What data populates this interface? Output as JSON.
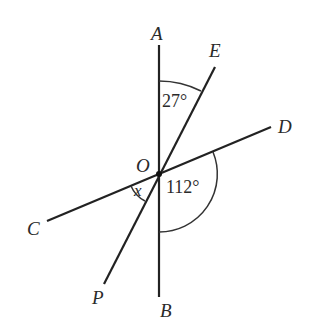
{
  "diagram": {
    "type": "intersecting-lines-angles",
    "center": {
      "label": "O",
      "x": 159,
      "y": 174
    },
    "colors": {
      "line": "#222222",
      "text": "#2a2a2a",
      "background": "#ffffff"
    },
    "lines": [
      {
        "name": "AB",
        "from": "A",
        "to": "B"
      },
      {
        "name": "CD",
        "from": "C",
        "to": "D"
      },
      {
        "name": "PE",
        "from": "P",
        "to": "E"
      }
    ],
    "points": {
      "A": {
        "label": "A",
        "x": 159,
        "y": 45
      },
      "B": {
        "label": "B",
        "x": 159,
        "y": 297
      },
      "C": {
        "label": "C",
        "x": 47,
        "y": 221
      },
      "D": {
        "label": "D",
        "x": 271,
        "y": 127
      },
      "E": {
        "label": "E",
        "x": 215,
        "y": 67
      },
      "P": {
        "label": "P",
        "x": 104,
        "y": 284
      }
    },
    "angles": [
      {
        "name": "angle-AOE",
        "label": "27°",
        "between": [
          "OA",
          "OE"
        ]
      },
      {
        "name": "angle-DOB",
        "label": "112°",
        "between": [
          "OD",
          "OB"
        ]
      },
      {
        "name": "angle-COP",
        "label": "x",
        "between": [
          "OC",
          "OP"
        ]
      }
    ]
  }
}
